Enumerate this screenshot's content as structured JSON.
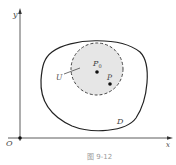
{
  "figure": {
    "caption": "图 9-12",
    "axes": {
      "x_label": "x",
      "y_label": "y",
      "origin_label": "O"
    },
    "region_label": "D",
    "neighborhood_label": "U",
    "points": [
      {
        "label": "P",
        "sub": "0"
      },
      {
        "label": "P",
        "sub": ""
      }
    ],
    "colors": {
      "stroke": "#222222",
      "neighborhood_fill": "#e6e6e6",
      "dash": "#444444"
    }
  }
}
